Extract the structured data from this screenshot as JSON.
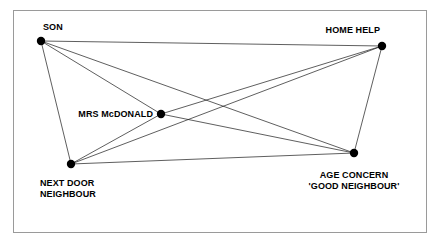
{
  "diagram": {
    "type": "sociogram",
    "title": "",
    "frame": {
      "border_color": "#9a9a9a",
      "background": "#ffffff",
      "x": 13,
      "y": 10,
      "width": 414,
      "height": 223
    },
    "style": {
      "node_color": "#000000",
      "node_radius": 4.2,
      "edge_color": "#1a1a1a",
      "edge_width": 0.7,
      "label_color": "#000000"
    },
    "nodes": [
      {
        "id": "son",
        "label": "SON",
        "x": 41,
        "y": 41,
        "label_x": 43,
        "label_y": 22,
        "align": "left"
      },
      {
        "id": "home-help",
        "label": "HOME HELP",
        "x": 382,
        "y": 46,
        "label_x": 380,
        "label_y": 25,
        "align": "right"
      },
      {
        "id": "mrs-mcdonald",
        "label": "MRS McDONALD",
        "x": 161,
        "y": 114,
        "label_x": 153,
        "label_y": 109,
        "align": "right"
      },
      {
        "id": "next-door-neighbour",
        "label": "NEXT DOOR\nNEIGHBOUR",
        "x": 71,
        "y": 164,
        "label_x": 40,
        "label_y": 178,
        "align": "left"
      },
      {
        "id": "age-concern",
        "label": "AGE CONCERN\n'GOOD NEIGHBOUR'",
        "x": 354,
        "y": 153,
        "label_x": 354,
        "label_y": 170,
        "align": "center"
      }
    ],
    "edges": [
      {
        "from": "son",
        "to": "home-help"
      },
      {
        "from": "son",
        "to": "mrs-mcdonald"
      },
      {
        "from": "son",
        "to": "next-door-neighbour"
      },
      {
        "from": "son",
        "to": "age-concern"
      },
      {
        "from": "home-help",
        "to": "mrs-mcdonald"
      },
      {
        "from": "home-help",
        "to": "next-door-neighbour"
      },
      {
        "from": "home-help",
        "to": "age-concern"
      },
      {
        "from": "mrs-mcdonald",
        "to": "next-door-neighbour"
      },
      {
        "from": "mrs-mcdonald",
        "to": "age-concern"
      },
      {
        "from": "next-door-neighbour",
        "to": "age-concern"
      }
    ]
  }
}
